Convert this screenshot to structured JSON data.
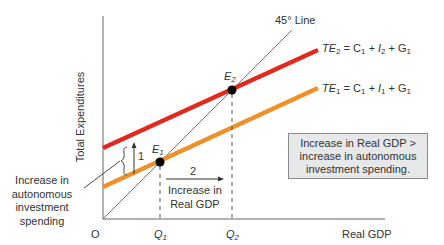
{
  "diagram": {
    "type": "keynesian-cross",
    "y_axis_title": "Total Expenditures",
    "x_axis_title": "Real GDP",
    "origin_label": "O",
    "line_45_label": "45° Line",
    "te2_label": {
      "prefix": "TE",
      "sub": "2",
      "eq": " = C",
      "c_sub": "1",
      "plus_i": " + I",
      "i_sub": "2",
      "plus_g": " + G",
      "g_sub": "1"
    },
    "te1_label": {
      "prefix": "TE",
      "sub": "1",
      "eq": " = C",
      "c_sub": "1",
      "plus_i": " + I",
      "i_sub": "1",
      "plus_g": " + G",
      "g_sub": "1"
    },
    "e1_label": {
      "main": "E",
      "sub": "1"
    },
    "e2_label": {
      "main": "E",
      "sub": "2"
    },
    "q1_label": {
      "main": "Q",
      "sub": "1"
    },
    "q2_label": {
      "main": "Q",
      "sub": "2"
    },
    "step1_label": "1",
    "step2_label": "2",
    "increase_gdp_label": [
      "Increase in",
      "Real GDP"
    ],
    "autonomous_label": [
      "Increase in",
      "autonomous",
      "investment",
      "spending"
    ],
    "note_box_text": "Increase in Real GDP > increase in autonomous investment spending.",
    "colors": {
      "te2_line": "#e02a1f",
      "te1_line": "#f0902a",
      "axis": "#999999",
      "line_45": "#555555",
      "box_fill": "#e6e8ea",
      "box_border": "#8c8c8c",
      "points": "#000000"
    }
  }
}
